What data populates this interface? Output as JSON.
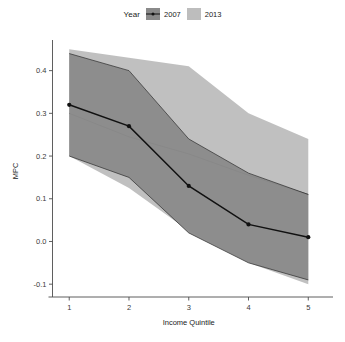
{
  "legend": {
    "title": "Year",
    "items": [
      {
        "label": "2007",
        "color": "#8a8a8a",
        "marker": "line-point"
      },
      {
        "label": "2013",
        "color": "#bdbdbd",
        "marker": "band"
      }
    ]
  },
  "chart_data": {
    "type": "line",
    "title": "",
    "xlabel": "Income Quintile",
    "ylabel": "MPC",
    "x": [
      1,
      2,
      3,
      4,
      5
    ],
    "xtick_labels": [
      "1",
      "2",
      "3",
      "4",
      "5"
    ],
    "ytick_labels": [
      "-0.1",
      "0.0",
      "0.1",
      "0.2",
      "0.3",
      "0.4"
    ],
    "yticks": [
      -0.1,
      0.0,
      0.1,
      0.2,
      0.3,
      0.4
    ],
    "xlim": [
      0.72,
      5.28
    ],
    "ylim": [
      -0.13,
      0.46
    ],
    "grid": false,
    "legend_position": "top-center",
    "series": [
      {
        "name": "2007",
        "color": "#8a8a8a",
        "line_color": "#111111",
        "values": [
          0.32,
          0.27,
          0.13,
          0.04,
          0.01
        ],
        "band_upper": [
          0.44,
          0.4,
          0.24,
          0.16,
          0.11
        ],
        "band_lower": [
          0.2,
          0.15,
          0.02,
          -0.05,
          -0.09
        ],
        "points_shown": true
      },
      {
        "name": "2013",
        "color": "#bdbdbd",
        "line_color": "#333333",
        "values": [
          0.3,
          0.245,
          0.205,
          0.155,
          0.11
        ],
        "band_upper": [
          0.45,
          0.43,
          0.41,
          0.3,
          0.24
        ],
        "band_lower": [
          0.2,
          0.125,
          0.025,
          -0.05,
          -0.1
        ],
        "points_shown": false
      }
    ]
  }
}
